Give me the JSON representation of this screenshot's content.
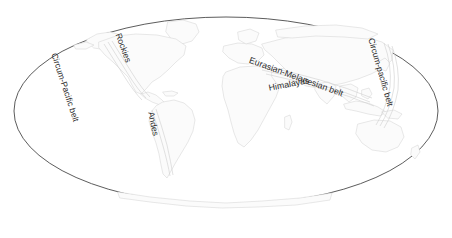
{
  "figure": {
    "type": "world-map-diagram",
    "projection": "Mollweide ellipse",
    "background_color": "#ffffff",
    "outline_color": "#4a4a4a",
    "land_fill_color": "#fbfbfb",
    "land_stroke_color": "#d8d8d8",
    "label_color": "#2b2b2b"
  },
  "labels": {
    "circum_pacific_west": "Circum-Pacific belt",
    "rockies": "Rockies",
    "andes": "Andes",
    "eurasian_melanesian": "Eurasian-Melanesian belt",
    "himalayas": "Himalayas",
    "circum_pacific_east": "Circum-pacific belt"
  },
  "regions": {
    "north_america": "North America",
    "south_america": "South America",
    "africa": "Africa",
    "eurasia": "Eurasia",
    "australia": "Australia",
    "antarctica": "Antarctica",
    "greenland": "Greenland"
  }
}
